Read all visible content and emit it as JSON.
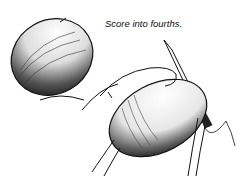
{
  "illustration": {
    "caption": "Score into fourths.",
    "ink_color": "#111111",
    "background": "#ffffff",
    "elements": [
      "whole-egg-shaded",
      "hands-holding-egg",
      "knife-scoring-egg"
    ]
  }
}
